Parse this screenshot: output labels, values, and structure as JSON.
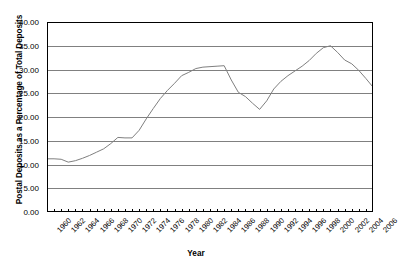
{
  "chart_data": {
    "type": "line",
    "title": "",
    "xlabel": "Year",
    "ylabel": "Postal Deposits as a Percentage of Total Deposits",
    "xlim": [
      1960,
      2006
    ],
    "ylim": [
      0.0,
      40.0
    ],
    "ytick_step": 5.0,
    "grid": true,
    "legend": false,
    "line_color": "#808080",
    "axis_color": "#000000",
    "gridline_color": "#808080",
    "ytick_labels": [
      "0.00",
      "5.00",
      "10.00",
      "15.00",
      "20.00",
      "25.00",
      "30.00",
      "35.00",
      "40.00"
    ],
    "ytick_values": [
      0,
      5,
      10,
      15,
      20,
      25,
      30,
      35,
      40
    ],
    "xtick_labels": [
      "1960",
      "1962",
      "1964",
      "1966",
      "1968",
      "1970",
      "1972",
      "1974",
      "1976",
      "1978",
      "1980",
      "1982",
      "1984",
      "1986",
      "1988",
      "1990",
      "1992",
      "1994",
      "1996",
      "1998",
      "2000",
      "2002",
      "2004",
      "2006"
    ],
    "xtick_values": [
      1960,
      1962,
      1964,
      1966,
      1968,
      1970,
      1972,
      1974,
      1976,
      1978,
      1980,
      1982,
      1984,
      1986,
      1988,
      1990,
      1992,
      1994,
      1996,
      1998,
      2000,
      2002,
      2004,
      2006
    ],
    "x": [
      1960,
      1961,
      1962,
      1963,
      1964,
      1965,
      1966,
      1967,
      1968,
      1969,
      1970,
      1971,
      1972,
      1973,
      1974,
      1975,
      1976,
      1977,
      1978,
      1979,
      1980,
      1981,
      1982,
      1983,
      1984,
      1985,
      1986,
      1987,
      1988,
      1989,
      1990,
      1991,
      1992,
      1993,
      1994,
      1995,
      1996,
      1997,
      1998,
      1999,
      2000,
      2001,
      2002,
      2003,
      2004,
      2005,
      2006
    ],
    "values": [
      11.2,
      11.2,
      11.1,
      10.5,
      10.8,
      11.3,
      11.9,
      12.6,
      13.3,
      14.4,
      15.7,
      15.6,
      15.6,
      17.2,
      19.6,
      21.8,
      23.9,
      25.6,
      27.1,
      28.7,
      29.4,
      30.2,
      30.5,
      30.6,
      30.7,
      30.8,
      27.8,
      25.2,
      24.3,
      22.9,
      21.6,
      23.4,
      25.9,
      27.5,
      28.7,
      29.7,
      30.7,
      31.9,
      33.4,
      34.6,
      35.0,
      33.6,
      32.0,
      31.2,
      29.8,
      28.1,
      26.3
    ]
  },
  "axis_titles": {
    "y": "Postal Deposits as a Percentage of Total Deposits",
    "x": "Year"
  }
}
